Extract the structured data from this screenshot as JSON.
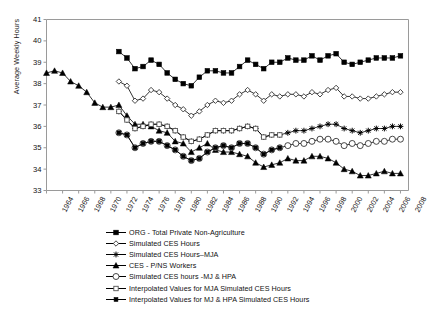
{
  "chart_data": {
    "type": "line",
    "title": "",
    "xlabel": "",
    "ylabel": "Average Weekly Hours",
    "ylim": [
      33,
      41
    ],
    "yticks": [
      33,
      34,
      35,
      36,
      37,
      38,
      39,
      40,
      41
    ],
    "xlim": [
      1964,
      2009
    ],
    "xticks": [
      1964,
      1966,
      1968,
      1970,
      1972,
      1974,
      1976,
      1978,
      1980,
      1982,
      1984,
      1986,
      1988,
      1990,
      1992,
      1994,
      1996,
      1998,
      2000,
      2002,
      2004,
      2006,
      2008
    ],
    "grid": false,
    "legend_position": "below",
    "series": [
      {
        "name": "ORG - Total Private Non-Agriculture",
        "marker": "filled-square",
        "x": [
          1964,
          1965,
          1966,
          1967,
          1968,
          1969,
          1970,
          1971,
          1972,
          1973,
          1974,
          1975,
          1976,
          1977,
          1978,
          1979,
          1980,
          1981,
          1982,
          1983,
          1984,
          1985,
          1986,
          1987,
          1988,
          1989,
          1990,
          1991,
          1992,
          1993,
          1994,
          1995,
          1996,
          1997,
          1998,
          1999,
          2000,
          2001,
          2002,
          2003,
          2004,
          2005,
          2006,
          2007,
          2008
        ],
        "values": [
          null,
          null,
          null,
          null,
          null,
          null,
          null,
          null,
          null,
          39.5,
          39.2,
          38.7,
          38.8,
          39.1,
          38.9,
          38.5,
          38.2,
          38.0,
          37.9,
          38.3,
          38.6,
          38.6,
          38.5,
          38.5,
          38.8,
          39.1,
          38.9,
          38.7,
          39.0,
          39.0,
          39.2,
          39.1,
          39.1,
          39.3,
          39.1,
          39.3,
          39.4,
          39.0,
          38.9,
          39.0,
          39.1,
          39.2,
          39.2,
          39.2,
          39.3
        ]
      },
      {
        "name": "Simulated CES Hours",
        "marker": "open-diamond",
        "x": [
          1964,
          1965,
          1966,
          1967,
          1968,
          1969,
          1970,
          1971,
          1972,
          1973,
          1974,
          1975,
          1976,
          1977,
          1978,
          1979,
          1980,
          1981,
          1982,
          1983,
          1984,
          1985,
          1986,
          1987,
          1988,
          1989,
          1990,
          1991,
          1992,
          1993,
          1994,
          1995,
          1996,
          1997,
          1998,
          1999,
          2000,
          2001,
          2002,
          2003,
          2004,
          2005,
          2006,
          2007,
          2008
        ],
        "values": [
          null,
          null,
          null,
          null,
          null,
          null,
          null,
          null,
          null,
          38.1,
          37.9,
          37.2,
          37.3,
          37.7,
          37.6,
          37.3,
          37.0,
          36.8,
          36.5,
          36.7,
          37.0,
          37.2,
          37.1,
          37.2,
          37.5,
          37.7,
          37.5,
          37.2,
          37.5,
          37.4,
          37.5,
          37.5,
          37.4,
          37.6,
          37.5,
          37.7,
          37.8,
          37.4,
          37.4,
          37.3,
          37.3,
          37.4,
          37.5,
          37.6,
          37.6
        ]
      },
      {
        "name": "Simulated CES Hours–MJA",
        "marker": "star",
        "x": [
          1964,
          1965,
          1966,
          1967,
          1968,
          1969,
          1970,
          1971,
          1972,
          1973,
          1974,
          1975,
          1976,
          1977,
          1978,
          1979,
          1980,
          1981,
          1982,
          1983,
          1984,
          1985,
          1986,
          1987,
          1988,
          1989,
          1990,
          1991,
          1992,
          1993,
          1994,
          1995,
          1996,
          1997,
          1998,
          1999,
          2000,
          2001,
          2002,
          2003,
          2004,
          2005,
          2006,
          2007,
          2008
        ],
        "values": [
          null,
          null,
          null,
          null,
          null,
          null,
          null,
          null,
          null,
          36.7,
          36.3,
          35.9,
          36.0,
          36.1,
          36.1,
          36.0,
          35.8,
          35.5,
          35.3,
          35.4,
          35.6,
          35.8,
          35.8,
          35.8,
          35.9,
          36.0,
          35.9,
          35.5,
          35.6,
          35.6,
          35.7,
          35.8,
          35.8,
          35.9,
          36.0,
          36.1,
          36.1,
          35.9,
          35.8,
          35.7,
          35.8,
          35.9,
          35.9,
          36.0,
          36.0
        ]
      },
      {
        "name": "CES - P/NS Workers",
        "marker": "filled-triangle",
        "x": [
          1964,
          1965,
          1966,
          1967,
          1968,
          1969,
          1970,
          1971,
          1972,
          1973,
          1974,
          1975,
          1976,
          1977,
          1978,
          1979,
          1980,
          1981,
          1982,
          1983,
          1984,
          1985,
          1986,
          1987,
          1988,
          1989,
          1990,
          1991,
          1992,
          1993,
          1994,
          1995,
          1996,
          1997,
          1998,
          1999,
          2000,
          2001,
          2002,
          2003,
          2004,
          2005,
          2006,
          2007,
          2008
        ],
        "values": [
          38.5,
          38.6,
          38.5,
          38.1,
          37.9,
          37.6,
          37.1,
          36.9,
          36.9,
          37.0,
          36.5,
          36.1,
          36.1,
          36.0,
          35.8,
          35.7,
          35.3,
          35.2,
          34.8,
          35.0,
          35.2,
          34.9,
          34.8,
          34.8,
          34.7,
          34.6,
          34.3,
          34.1,
          34.2,
          34.3,
          34.5,
          34.4,
          34.4,
          34.6,
          34.6,
          34.5,
          34.3,
          34.0,
          33.9,
          33.7,
          33.7,
          33.8,
          33.9,
          33.8,
          33.8
        ]
      },
      {
        "name": "Simulated CES hours -MJ & HPA",
        "marker": "open-circle-large",
        "x": [
          1964,
          1965,
          1966,
          1967,
          1968,
          1969,
          1970,
          1971,
          1972,
          1973,
          1974,
          1975,
          1976,
          1977,
          1978,
          1979,
          1980,
          1981,
          1982,
          1983,
          1984,
          1985,
          1986,
          1987,
          1988,
          1989,
          1990,
          1991,
          1992,
          1993,
          1994,
          1995,
          1996,
          1997,
          1998,
          1999,
          2000,
          2001,
          2002,
          2003,
          2004,
          2005,
          2006,
          2007,
          2008
        ],
        "values": [
          null,
          null,
          null,
          null,
          null,
          null,
          null,
          null,
          null,
          35.7,
          35.6,
          35.0,
          35.2,
          35.3,
          35.3,
          35.1,
          34.9,
          34.6,
          34.4,
          34.5,
          34.8,
          35.0,
          35.1,
          35.0,
          35.2,
          35.2,
          35.0,
          34.7,
          34.9,
          35.0,
          35.1,
          35.2,
          35.2,
          35.3,
          35.4,
          35.4,
          35.3,
          35.1,
          35.2,
          35.1,
          35.2,
          35.3,
          35.3,
          35.4,
          35.4
        ]
      },
      {
        "name": "Interpolated Values for MJA Simulated CES Hours",
        "marker": "open-square-small",
        "x": [
          1964,
          1965,
          1966,
          1967,
          1968,
          1969,
          1970,
          1971,
          1972,
          1973,
          1974,
          1975,
          1976,
          1977,
          1978,
          1979,
          1980,
          1981,
          1982,
          1983,
          1984,
          1985,
          1986,
          1987,
          1988,
          1989,
          1990,
          1991,
          1992,
          1993,
          1994,
          1995,
          1996,
          1997,
          1998,
          1999,
          2000,
          2001,
          2002,
          2003,
          2004,
          2005,
          2006,
          2007,
          2008
        ],
        "values": [
          null,
          null,
          null,
          null,
          null,
          null,
          null,
          null,
          null,
          36.7,
          36.3,
          35.9,
          36.0,
          36.1,
          36.1,
          36.0,
          35.8,
          35.5,
          35.3,
          35.4,
          35.6,
          35.8,
          35.8,
          35.8,
          35.9,
          36.0,
          35.9,
          35.5,
          35.6,
          35.6,
          null,
          null,
          null,
          null,
          null,
          null,
          null,
          null,
          null,
          null,
          null,
          null,
          null,
          null,
          null
        ]
      },
      {
        "name": "Interpolated Values for MJ & HPA Simulated CES Hours",
        "marker": "filled-square-small",
        "x": [
          1964,
          1965,
          1966,
          1967,
          1968,
          1969,
          1970,
          1971,
          1972,
          1973,
          1974,
          1975,
          1976,
          1977,
          1978,
          1979,
          1980,
          1981,
          1982,
          1983,
          1984,
          1985,
          1986,
          1987,
          1988,
          1989,
          1990,
          1991,
          1992,
          1993,
          1994,
          1995,
          1996,
          1997,
          1998,
          1999,
          2000,
          2001,
          2002,
          2003,
          2004,
          2005,
          2006,
          2007,
          2008
        ],
        "values": [
          null,
          null,
          null,
          null,
          null,
          null,
          null,
          null,
          null,
          35.7,
          35.6,
          35.0,
          35.2,
          35.3,
          35.3,
          35.1,
          34.9,
          34.6,
          34.4,
          34.5,
          34.8,
          35.0,
          35.1,
          35.0,
          35.2,
          35.2,
          35.0,
          34.7,
          34.9,
          35.0,
          null,
          null,
          null,
          null,
          null,
          null,
          null,
          null,
          null,
          null,
          null,
          null,
          null,
          null,
          null
        ]
      }
    ]
  },
  "axis": {
    "y_title": "Average Weekly Hours",
    "y_ticks": [
      "41",
      "40",
      "39",
      "38",
      "37",
      "36",
      "35",
      "34",
      "33"
    ],
    "x_ticks": [
      "1964",
      "1966",
      "1968",
      "1970",
      "1972",
      "1974",
      "1976",
      "1978",
      "1980",
      "1982",
      "1984",
      "1986",
      "1988",
      "1990",
      "1992",
      "1994",
      "1996",
      "1998",
      "2000",
      "2002",
      "2004",
      "2006",
      "2008"
    ]
  },
  "legend": {
    "items": [
      {
        "label": "ORG - Total Private Non-Agriculture",
        "marker": "filled-square"
      },
      {
        "label": "Simulated CES Hours",
        "marker": "open-diamond"
      },
      {
        "label": "Simulated CES Hours–MJA",
        "marker": "star"
      },
      {
        "label": "CES - P/NS Workers",
        "marker": "filled-triangle"
      },
      {
        "label": "Simulated CES hours -MJ & HPA",
        "marker": "open-circle-large"
      },
      {
        "label": "Interpolated Values for MJA Simulated CES Hours",
        "marker": "open-square-small"
      },
      {
        "label": "Interpolated Values for MJ & HPA Simulated CES Hours",
        "marker": "filled-square-small"
      }
    ]
  },
  "colors": {
    "line": "#000000",
    "axis": "#808080",
    "text": "#111111",
    "background": "#ffffff"
  }
}
